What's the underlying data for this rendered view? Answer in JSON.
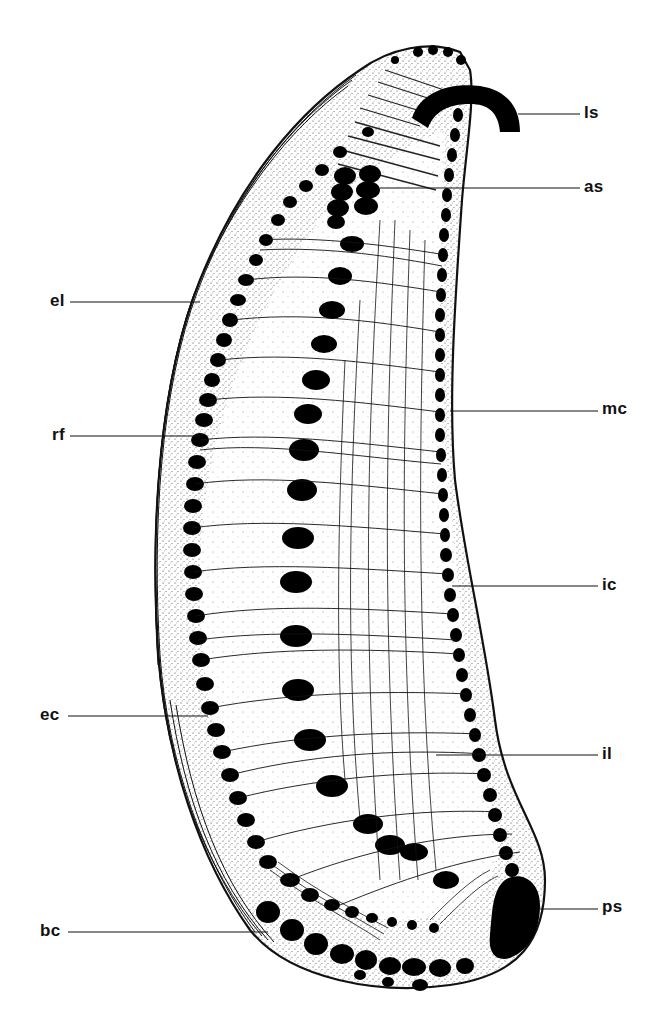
{
  "figure": {
    "type": "anatomical line drawing",
    "colors": {
      "ink": "#111111",
      "paper": "#ffffff",
      "stipple": "#555555"
    }
  },
  "labels": [
    {
      "id": "ls",
      "text": "ls",
      "side": "right",
      "x": 584,
      "y": 104,
      "line_x1": 518,
      "line_x2": 580,
      "line_y": 114
    },
    {
      "id": "as",
      "text": "as",
      "side": "right",
      "x": 584,
      "y": 178,
      "line_x1": 380,
      "line_x2": 580,
      "line_y": 188
    },
    {
      "id": "el",
      "text": "el",
      "side": "left",
      "x": 50,
      "y": 292,
      "line_x1": 70,
      "line_x2": 200,
      "line_y": 302
    },
    {
      "id": "mc",
      "text": "mc",
      "side": "right",
      "x": 602,
      "y": 400,
      "line_x1": 450,
      "line_x2": 598,
      "line_y": 411
    },
    {
      "id": "rf",
      "text": "rf",
      "side": "left",
      "x": 52,
      "y": 426,
      "line_x1": 70,
      "line_x2": 200,
      "line_y": 436
    },
    {
      "id": "ic",
      "text": "ic",
      "side": "right",
      "x": 602,
      "y": 576,
      "line_x1": 452,
      "line_x2": 598,
      "line_y": 586
    },
    {
      "id": "ec",
      "text": "ec",
      "side": "left",
      "x": 40,
      "y": 706,
      "line_x1": 68,
      "line_x2": 208,
      "line_y": 716
    },
    {
      "id": "il",
      "text": "il",
      "side": "right",
      "x": 602,
      "y": 745,
      "line_x1": 436,
      "line_x2": 598,
      "line_y": 755
    },
    {
      "id": "ps",
      "text": "ps",
      "side": "right",
      "x": 602,
      "y": 898,
      "line_x1": 540,
      "line_x2": 598,
      "line_y": 909
    },
    {
      "id": "bc",
      "text": "bc",
      "side": "left",
      "x": 40,
      "y": 922,
      "line_x1": 68,
      "line_x2": 268,
      "line_y": 932
    }
  ]
}
